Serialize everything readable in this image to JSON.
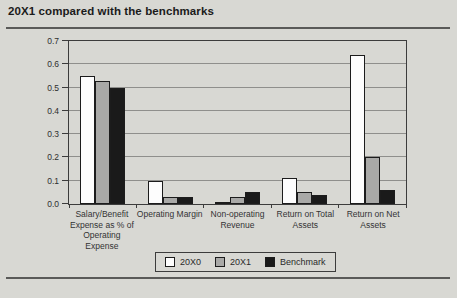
{
  "title": "20X1 compared with the benchmarks",
  "colors": {
    "background": "#d8d8d3",
    "axis": "#3c3c3c",
    "gridline": "#8f8f8c",
    "rule": "#5a5a58",
    "bar_white": "#fdfdfd",
    "bar_gray": "#a9a9a7",
    "bar_black": "#1a1a1a"
  },
  "chart_data": {
    "type": "bar",
    "title": "20X1 compared with the benchmarks",
    "categories": [
      "Salary/Benefit Expense as % of Operating Expense",
      "Operating Margin",
      "Non-operating Revenue",
      "Return on Total Assets",
      "Return on Net Assets"
    ],
    "series": [
      {
        "name": "20X0",
        "color": "#fdfdfd",
        "values": [
          0.55,
          0.1,
          0.01,
          0.11,
          0.64
        ]
      },
      {
        "name": "20X1",
        "color": "#a9a9a7",
        "values": [
          0.53,
          0.03,
          0.03,
          0.05,
          0.2
        ]
      },
      {
        "name": "Benchmark",
        "color": "#1a1a1a",
        "values": [
          0.5,
          0.03,
          0.05,
          0.04,
          0.06
        ]
      }
    ],
    "xlabel": "",
    "ylabel": "",
    "ylim": [
      0,
      0.7
    ],
    "ytick_step": 0.1,
    "yticks": [
      "0.0",
      "0.1",
      "0.2",
      "0.3",
      "0.4",
      "0.5",
      "0.6",
      "0.7"
    ],
    "grid": true,
    "legend_position": "bottom",
    "legend": [
      "20X0",
      "20X1",
      "Benchmark"
    ]
  }
}
